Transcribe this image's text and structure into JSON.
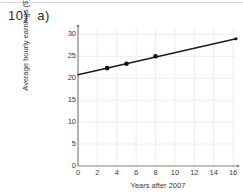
{
  "question": {
    "number": "10)",
    "part": "a)"
  },
  "chart_data": {
    "type": "line",
    "title": "",
    "xlabel": "Years after 2007",
    "ylabel": "Average hourly earnings ($)",
    "xlim": [
      0,
      16.3
    ],
    "ylim": [
      0,
      31
    ],
    "xticks": [
      0,
      2,
      4,
      6,
      8,
      10,
      12,
      14,
      16
    ],
    "yticks": [
      0,
      5,
      10,
      15,
      20,
      25,
      30
    ],
    "grid": true,
    "legend": "none",
    "series": [
      {
        "name": "line-of-best-fit",
        "kind": "trendline",
        "x": [
          0,
          16.3
        ],
        "values": [
          20.8,
          29.0
        ]
      },
      {
        "name": "data-points",
        "kind": "scatter",
        "x": [
          3,
          5,
          8,
          16.3
        ],
        "values": [
          22.3,
          23.3,
          25.0,
          29.0
        ]
      }
    ]
  },
  "colors": {
    "line": "#1a1a1a",
    "marker": "#111111",
    "axis": "#808080",
    "grid": "#ededed",
    "text": "#3a3a3a",
    "rule": "#d8d8d8"
  }
}
